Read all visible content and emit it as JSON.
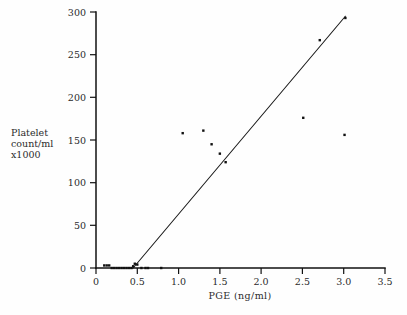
{
  "figure": {
    "background_color": "#fefefe",
    "ink_color": "#111111"
  },
  "chart_data": {
    "type": "scatter",
    "title": "",
    "xlabel": "PGE (ng/ml)",
    "ylabel": "Platelet count/ml x1000",
    "ylabel_lines": [
      "Platelet",
      "count/ml",
      "x1000"
    ],
    "xlim": [
      0,
      3.5
    ],
    "ylim": [
      0,
      300
    ],
    "xticks": [
      0,
      0.5,
      1.0,
      1.5,
      2.0,
      2.5,
      3.0,
      3.5
    ],
    "xtick_labels": [
      "0",
      "0.5",
      "1.0",
      "1.5",
      "2.0",
      "2.5",
      "3.0",
      "3.5"
    ],
    "yticks": [
      0,
      50,
      100,
      150,
      200,
      250,
      300
    ],
    "ytick_labels": [
      "0",
      "50",
      "100",
      "150",
      "200",
      "250",
      "300"
    ],
    "grid": false,
    "legend": null,
    "tick_direction": "out",
    "marker": "square-dot",
    "marker_size_px": 2.4,
    "points": [
      {
        "x": 0.1,
        "y": 3
      },
      {
        "x": 0.13,
        "y": 3
      },
      {
        "x": 0.16,
        "y": 3
      },
      {
        "x": 0.19,
        "y": 0
      },
      {
        "x": 0.22,
        "y": 0
      },
      {
        "x": 0.25,
        "y": 0
      },
      {
        "x": 0.28,
        "y": 0
      },
      {
        "x": 0.31,
        "y": 0
      },
      {
        "x": 0.34,
        "y": 0
      },
      {
        "x": 0.37,
        "y": 0
      },
      {
        "x": 0.4,
        "y": 0
      },
      {
        "x": 0.43,
        "y": 0
      },
      {
        "x": 0.45,
        "y": 2
      },
      {
        "x": 0.47,
        "y": 5
      },
      {
        "x": 0.5,
        "y": 4
      },
      {
        "x": 0.55,
        "y": 0
      },
      {
        "x": 0.6,
        "y": 0
      },
      {
        "x": 0.63,
        "y": 0
      },
      {
        "x": 0.79,
        "y": 0
      },
      {
        "x": 1.05,
        "y": 158
      },
      {
        "x": 1.3,
        "y": 161
      },
      {
        "x": 1.4,
        "y": 145
      },
      {
        "x": 1.5,
        "y": 134
      },
      {
        "x": 1.57,
        "y": 124
      },
      {
        "x": 2.51,
        "y": 176
      },
      {
        "x": 2.71,
        "y": 267
      },
      {
        "x": 3.01,
        "y": 156
      },
      {
        "x": 3.02,
        "y": 293
      }
    ],
    "fit_line": {
      "label": "",
      "x_start": 0.45,
      "y_start": 0,
      "x_end": 3.02,
      "y_end": 295
    }
  }
}
